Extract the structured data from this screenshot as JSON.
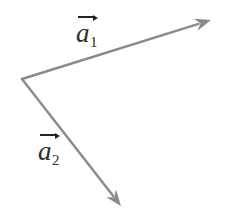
{
  "figure": {
    "type": "vector-diagram",
    "width": 226,
    "height": 209,
    "background_color": "#ffffff",
    "stroke_color": "#8a8a8a",
    "arrowhead_color": "#8a8a8a",
    "text_color": "#2e2e2e",
    "origin": {
      "x": 22,
      "y": 79
    }
  },
  "vectors": [
    {
      "id": "a1",
      "label_base": "a",
      "label_subscript": "1",
      "start": {
        "x": 22,
        "y": 79
      },
      "end": {
        "x": 211,
        "y": 20
      },
      "stroke_width": 2.4,
      "direction": "up-right"
    },
    {
      "id": "a2",
      "label_base": "a",
      "label_subscript": "2",
      "start": {
        "x": 22,
        "y": 79
      },
      "end": {
        "x": 121,
        "y": 206
      },
      "stroke_width": 2.4,
      "direction": "down-right"
    }
  ],
  "labels": {
    "a1": {
      "base": "a",
      "subscript": "1"
    },
    "a2": {
      "base": "a",
      "subscript": "2"
    }
  }
}
